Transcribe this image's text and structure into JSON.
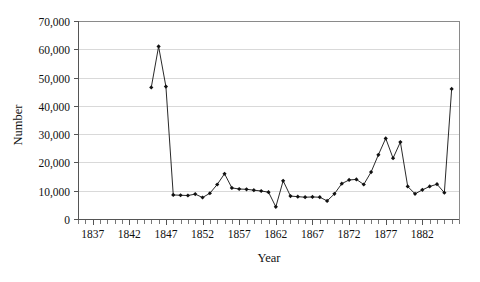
{
  "chart_data": {
    "type": "line",
    "title": "",
    "xlabel": "Year",
    "ylabel": "Number",
    "xlim": [
      1835,
      1887
    ],
    "ylim": [
      0,
      70000
    ],
    "grid": true,
    "legend": false,
    "marker": "diamond",
    "xticklabels": [
      "1837",
      "1842",
      "1847",
      "1852",
      "1857",
      "1862",
      "1867",
      "1872",
      "1877",
      "1882"
    ],
    "xtickvalues": [
      1837,
      1842,
      1847,
      1852,
      1857,
      1862,
      1867,
      1872,
      1877,
      1882
    ],
    "yticklabels": [
      "0",
      "10,000",
      "20,000",
      "30,000",
      "40,000",
      "50,000",
      "60,000",
      "70,000"
    ],
    "ytickvalues": [
      0,
      10000,
      20000,
      30000,
      40000,
      50000,
      60000,
      70000
    ],
    "x": [
      1845,
      1846,
      1847,
      1848,
      1849,
      1850,
      1851,
      1852,
      1853,
      1854,
      1855,
      1856,
      1857,
      1858,
      1859,
      1860,
      1861,
      1862,
      1863,
      1864,
      1865,
      1866,
      1867,
      1868,
      1869,
      1870,
      1871,
      1872,
      1873,
      1874,
      1875,
      1876,
      1877,
      1878,
      1879,
      1880,
      1881,
      1882,
      1883,
      1884,
      1885,
      1886
    ],
    "values": [
      46500,
      61000,
      46800,
      8500,
      8400,
      8300,
      8800,
      7600,
      9100,
      12200,
      16000,
      11000,
      10600,
      10500,
      10200,
      9900,
      9500,
      4300,
      13500,
      8100,
      7900,
      7700,
      7800,
      7700,
      6400,
      8900,
      12500,
      13800,
      14000,
      12200,
      16600,
      22700,
      28500,
      21500,
      27200,
      11500,
      8900,
      10300,
      11500,
      12300,
      9300,
      46000
    ],
    "series": [
      {
        "name": "Number",
        "values": [
          46500,
          61000,
          46800,
          8500,
          8400,
          8300,
          8800,
          7600,
          9100,
          12200,
          16000,
          11000,
          10600,
          10500,
          10200,
          9900,
          9500,
          4300,
          13500,
          8100,
          7900,
          7700,
          7800,
          7700,
          6400,
          8900,
          12500,
          13800,
          14000,
          12200,
          16600,
          22700,
          28500,
          21500,
          27200,
          11500,
          8900,
          10300,
          11500,
          12300,
          9300,
          46000
        ]
      }
    ],
    "colors": {
      "line": "#111111",
      "marker": "#111111",
      "grid": "#d9d9d9",
      "frame": "#8a8a8a",
      "background": "#ffffff"
    }
  }
}
